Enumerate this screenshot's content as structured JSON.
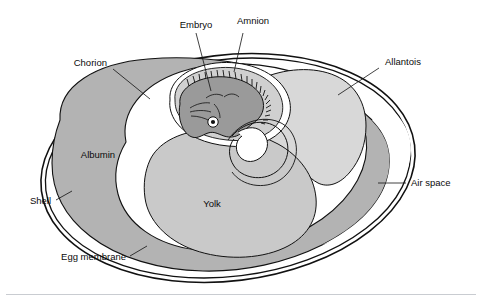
{
  "figure": {
    "background_color": "#ffffff"
  },
  "labels": {
    "embryo": "Embryo",
    "amnion": "Amnion",
    "chorion": "Chorion",
    "allantois": "Allantois",
    "albumin": "Albumin",
    "yolk": "Yolk",
    "shell": "Shell",
    "egg_membrane": "Egg membrane",
    "air_space": "Air space"
  },
  "colors": {
    "outline": "#111111",
    "albumin_fill": "#b3b3b3",
    "yolk_fill": "#c9c9c9",
    "allantois_fill": "#d8d8d8",
    "amnion_cavity_fill": "#d0d0d0",
    "embryo_fill": "#9a9a9a",
    "white_fill": "#ffffff",
    "text": "#0b0b0b",
    "footer_rule": "#c9ccd1"
  },
  "structures": [
    {
      "name": "shell",
      "label": "Shell",
      "fill": "none"
    },
    {
      "name": "egg-membrane",
      "label": "Egg membrane",
      "fill": "none"
    },
    {
      "name": "air-space",
      "label": "Air space",
      "fill": "#ffffff"
    },
    {
      "name": "albumin",
      "label": "Albumin",
      "fill": "#b3b3b3"
    },
    {
      "name": "chorion",
      "label": "Chorion",
      "fill": "none"
    },
    {
      "name": "yolk",
      "label": "Yolk",
      "fill": "#c9c9c9"
    },
    {
      "name": "allantois",
      "label": "Allantois",
      "fill": "#d8d8d8"
    },
    {
      "name": "amnion",
      "label": "Amnion",
      "fill": "#d0d0d0"
    },
    {
      "name": "embryo",
      "label": "Embryo",
      "fill": "#9a9a9a"
    }
  ]
}
